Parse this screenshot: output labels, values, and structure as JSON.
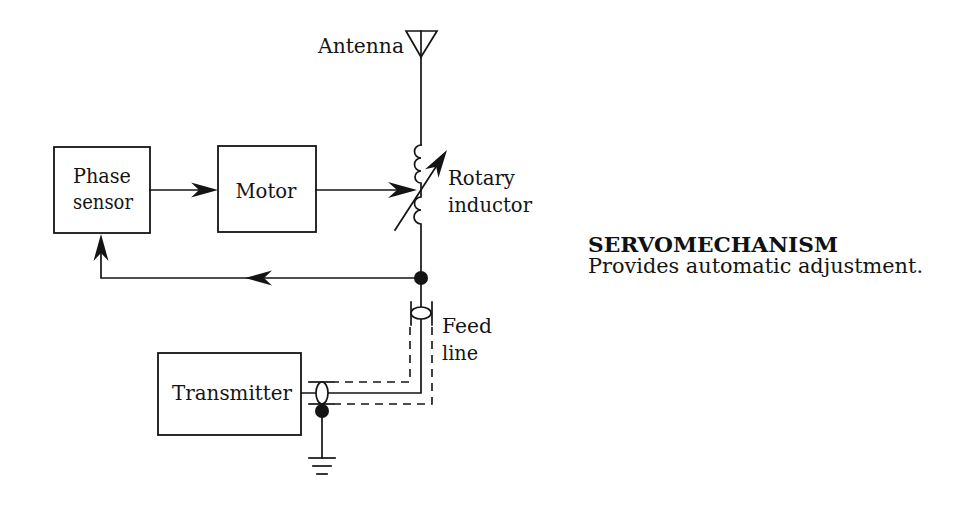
{
  "colors": {
    "ink": "#141414",
    "background": "#ffffff"
  },
  "diagram": {
    "blocks": {
      "phase_sensor": {
        "line1": "Phase",
        "line2": "sensor"
      },
      "motor": {
        "label": "Motor"
      },
      "transmitter": {
        "label": "Transmitter"
      }
    },
    "labels": {
      "antenna": "Antenna",
      "rotary_inductor": {
        "line1": "Rotary",
        "line2": "inductor"
      },
      "feed_line": {
        "line1": "Feed",
        "line2": "line"
      }
    },
    "connections": [
      {
        "from": "Phase sensor",
        "to": "Motor",
        "style": "arrow"
      },
      {
        "from": "Motor",
        "to": "Rotary inductor",
        "style": "arrow"
      },
      {
        "from": "Antenna",
        "to": "Rotary inductor",
        "style": "line"
      },
      {
        "from": "Rotary inductor",
        "to": "Junction",
        "style": "line"
      },
      {
        "from": "Junction",
        "to": "Phase sensor",
        "style": "arrow (feedback)"
      },
      {
        "from": "Junction",
        "to": "Transmitter",
        "style": "coaxial feed line"
      },
      {
        "from": "Transmitter",
        "to": "Ground",
        "style": "line"
      }
    ]
  },
  "caption": {
    "title": "SERVOMECHANISM",
    "text": "Provides automatic adjustment."
  }
}
